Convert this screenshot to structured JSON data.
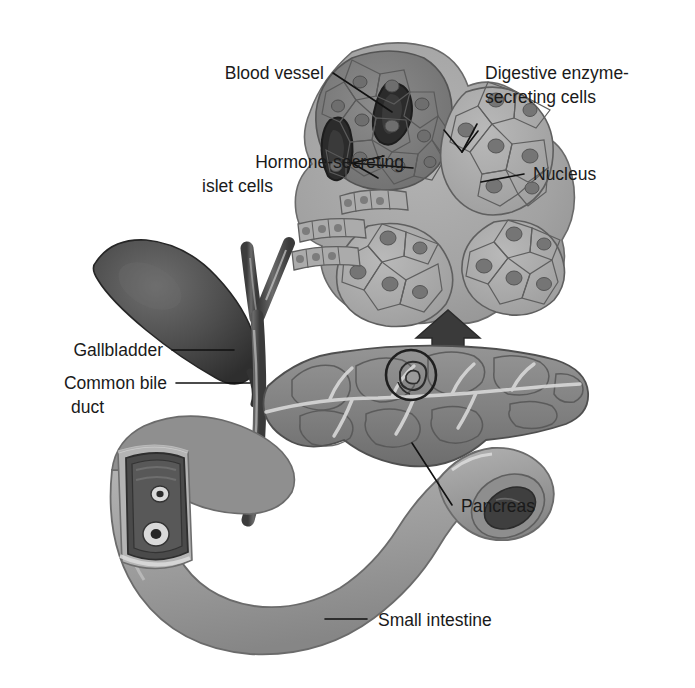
{
  "figure": {
    "type": "anatomical-illustration",
    "background_color": "#ffffff",
    "label_color": "#1a1a1a"
  },
  "labels": {
    "blood_vessel": "Blood vessel",
    "digestive_enzyme_line1": "Digestive enzyme-",
    "digestive_enzyme_line2": "secreting cells",
    "hormone_line1": "Hormone-secreting",
    "hormone_line2": "islet cells",
    "nucleus": "Nucleus",
    "gallbladder": "Gallbladder",
    "common_bile_line1": "Common bile",
    "common_bile_line2": "duct",
    "pancreas": "Pancreas",
    "small_intestine": "Small intestine"
  },
  "structures": {
    "gallbladder": {
      "name": "gallbladder",
      "tone": "#4a4a4a"
    },
    "hepatic_ducts": {
      "name": "hepatic-ducts",
      "tone": "#5c5c5c"
    },
    "common_bile_duct": {
      "name": "common-bile-duct",
      "tone": "#5c5c5c"
    },
    "pancreas": {
      "name": "pancreas",
      "tone": "#8a8a8a"
    },
    "small_intestine": {
      "name": "small-intestine",
      "tone": "#9a9a9a"
    },
    "duodenum_cutaway": {
      "name": "duodenum-cutaway",
      "tone": "#4f4f4f"
    },
    "inset_tissue": {
      "name": "pancreatic-tissue-inset",
      "tone": "#a6a6a6"
    },
    "islet": {
      "name": "islet-of-langerhans",
      "tone": "#7d7d7d"
    },
    "callout_circle": {
      "name": "magnification-callout-circle"
    },
    "callout_arrow": {
      "name": "magnification-arrow"
    }
  }
}
